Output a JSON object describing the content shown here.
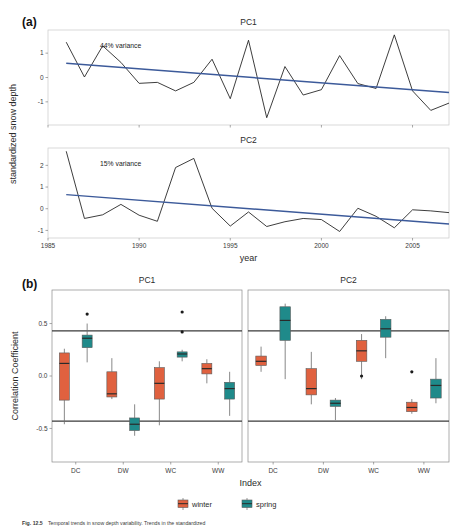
{
  "figure": {
    "panel_a_label": "(a)",
    "panel_b_label": "(b)",
    "caption_number": "Fig. 12.5",
    "caption_text": "Temporal trends in snow depth variability. Trends in the standardized"
  },
  "panel_a": {
    "ylabel": "standardized snow depth",
    "xlabel": "year",
    "facets": [
      {
        "title": "PC1",
        "annotation": "44% variance",
        "y_ticks": [
          "-1",
          "0",
          "1"
        ],
        "y_tick_values": [
          -1,
          0,
          1
        ]
      },
      {
        "title": "PC2",
        "annotation": "15% variance",
        "y_ticks": [
          "-1",
          "0",
          "1",
          "2"
        ],
        "y_tick_values": [
          -1,
          0,
          1,
          2
        ]
      }
    ],
    "x_ticks": [
      "1985",
      "1990",
      "1995",
      "2000",
      "2005"
    ],
    "x_tick_values": [
      1985,
      1990,
      1995,
      2000,
      2005
    ],
    "trend_color": "#3c5a9a",
    "line_color": "#1b1b1b"
  },
  "panel_b": {
    "ylabel": "Correlation Coefficient",
    "xlabel": "Index",
    "y_ticks": [
      "0.5",
      "0.0",
      "-0.5"
    ],
    "y_tick_values": [
      0.5,
      0.0,
      -0.5
    ],
    "x_categories": [
      "DC",
      "DW",
      "WC",
      "WW"
    ],
    "facets": [
      {
        "title": "PC1"
      },
      {
        "title": "PC2"
      }
    ],
    "significance_lines": [
      0.43,
      -0.43
    ],
    "legend": [
      {
        "label": "winter",
        "color": "#e0613f"
      },
      {
        "label": "spring",
        "color": "#1f8a8a"
      }
    ]
  },
  "chart_data": [
    {
      "type": "line",
      "title": "PC1",
      "xlabel": "year",
      "ylabel": "standardized snow depth",
      "annotation": "44% variance",
      "xlim": [
        1985,
        2007
      ],
      "ylim": [
        -1.95,
        1.95
      ],
      "x": [
        1986,
        1987,
        1988,
        1989,
        1990,
        1991,
        1992,
        1993,
        1994,
        1995,
        1996,
        1997,
        1998,
        1999,
        2000,
        2001,
        2002,
        2003,
        2004,
        2005,
        2006,
        2007
      ],
      "series": [
        {
          "name": "PC1 score",
          "values": [
            1.45,
            0.02,
            1.3,
            0.62,
            -0.24,
            -0.2,
            -0.55,
            -0.2,
            0.75,
            -0.87,
            1.53,
            -1.65,
            0.45,
            -0.72,
            -0.5,
            0.9,
            -0.25,
            -0.45,
            1.75,
            -0.55,
            -1.35,
            -1.05
          ]
        },
        {
          "name": "linear trend",
          "type": "trend",
          "values": [
            0.58,
            -0.62
          ],
          "x_endpoints": [
            1986,
            2007
          ]
        }
      ]
    },
    {
      "type": "line",
      "title": "PC2",
      "xlabel": "year",
      "ylabel": "standardized snow depth",
      "annotation": "15% variance",
      "xlim": [
        1985,
        2007
      ],
      "ylim": [
        -1.35,
        2.8
      ],
      "x": [
        1986,
        1987,
        1988,
        1989,
        1990,
        1991,
        1992,
        1993,
        1994,
        1995,
        1996,
        1997,
        1998,
        1999,
        2000,
        2001,
        2002,
        2003,
        2004,
        2005,
        2006,
        2007
      ],
      "series": [
        {
          "name": "PC2 score",
          "values": [
            2.65,
            -0.45,
            -0.28,
            0.2,
            -0.3,
            -0.58,
            1.9,
            2.32,
            0.02,
            -0.8,
            -0.15,
            -0.82,
            -0.6,
            -0.45,
            -0.5,
            -1.05,
            0.02,
            -0.35,
            -0.88,
            -0.05,
            -0.1,
            -0.18
          ]
        },
        {
          "name": "linear trend",
          "type": "trend",
          "values": [
            0.65,
            -0.7
          ],
          "x_endpoints": [
            1986,
            2007
          ]
        }
      ]
    },
    {
      "type": "box",
      "title": "PC1",
      "xlabel": "Index",
      "ylabel": "Correlation Coefficient",
      "ylim": [
        -0.82,
        0.82
      ],
      "categories": [
        "DC",
        "DW",
        "WC",
        "WW"
      ],
      "hlines": [
        0.43,
        -0.43
      ],
      "series": [
        {
          "name": "winter",
          "color": "#e0613f",
          "boxes": [
            {
              "category": "DC",
              "min": -0.46,
              "q1": -0.23,
              "median": 0.12,
              "q3": 0.22,
              "max": 0.26,
              "outliers": []
            },
            {
              "category": "DW",
              "min": -0.22,
              "q1": -0.2,
              "median": -0.17,
              "q3": 0.04,
              "max": 0.17,
              "outliers": []
            },
            {
              "category": "WC",
              "min": -0.47,
              "q1": -0.22,
              "median": -0.07,
              "q3": 0.08,
              "max": 0.14,
              "outliers": []
            },
            {
              "category": "WW",
              "min": -0.07,
              "q1": 0.02,
              "median": 0.07,
              "q3": 0.12,
              "max": 0.16,
              "outliers": []
            }
          ]
        },
        {
          "name": "spring",
          "color": "#1f8a8a",
          "boxes": [
            {
              "category": "DC",
              "min": 0.13,
              "q1": 0.27,
              "median": 0.36,
              "q3": 0.39,
              "max": 0.5,
              "outliers": [
                0.59
              ]
            },
            {
              "category": "DW",
              "min": -0.57,
              "q1": -0.52,
              "median": -0.46,
              "q3": -0.4,
              "max": -0.27,
              "outliers": []
            },
            {
              "category": "WC",
              "min": 0.14,
              "q1": 0.18,
              "median": 0.21,
              "q3": 0.23,
              "max": 0.25,
              "outliers": [
                0.61,
                0.42
              ]
            },
            {
              "category": "WW",
              "min": -0.38,
              "q1": -0.22,
              "median": -0.12,
              "q3": -0.06,
              "max": 0.04,
              "outliers": []
            }
          ]
        }
      ]
    },
    {
      "type": "box",
      "title": "PC2",
      "xlabel": "Index",
      "ylabel": "Correlation Coefficient",
      "ylim": [
        -0.82,
        0.82
      ],
      "categories": [
        "DC",
        "DW",
        "WC",
        "WW"
      ],
      "hlines": [
        0.43,
        -0.43
      ],
      "series": [
        {
          "name": "winter",
          "color": "#e0613f",
          "boxes": [
            {
              "category": "DC",
              "min": 0.04,
              "q1": 0.1,
              "median": 0.14,
              "q3": 0.19,
              "max": 0.28,
              "outliers": []
            },
            {
              "category": "DW",
              "min": -0.27,
              "q1": -0.18,
              "median": -0.12,
              "q3": 0.07,
              "max": 0.23,
              "outliers": []
            },
            {
              "category": "WC",
              "min": -0.03,
              "q1": 0.14,
              "median": 0.24,
              "q3": 0.34,
              "max": 0.4,
              "outliers": [
                0.0
              ]
            },
            {
              "category": "WW",
              "min": -0.36,
              "q1": -0.34,
              "median": -0.3,
              "q3": -0.25,
              "max": -0.22,
              "outliers": [
                0.04
              ]
            }
          ]
        },
        {
          "name": "spring",
          "color": "#1f8a8a",
          "boxes": [
            {
              "category": "DC",
              "min": -0.03,
              "q1": 0.34,
              "median": 0.53,
              "q3": 0.66,
              "max": 0.69,
              "outliers": []
            },
            {
              "category": "DW",
              "min": -0.42,
              "q1": -0.29,
              "median": -0.26,
              "q3": -0.23,
              "max": -0.21,
              "outliers": []
            },
            {
              "category": "WC",
              "min": 0.17,
              "q1": 0.37,
              "median": 0.45,
              "q3": 0.54,
              "max": 0.57,
              "outliers": []
            },
            {
              "category": "WW",
              "min": -0.26,
              "q1": -0.21,
              "median": -0.09,
              "q3": -0.03,
              "max": 0.17,
              "outliers": []
            }
          ]
        }
      ]
    }
  ]
}
